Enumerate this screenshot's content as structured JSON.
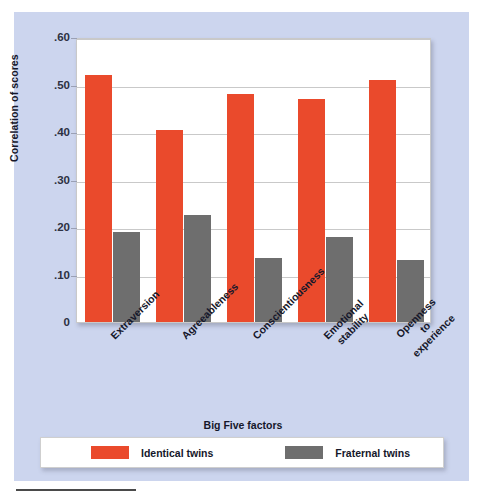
{
  "figure": {
    "background_color": "#ccd5ee",
    "plot_background_color": "#ffffff"
  },
  "colors": {
    "identical_twins": "#ea4a2c",
    "fraternal_twins": "#6e6e6e",
    "gridline": "#c9c9c9",
    "text": "#15172a"
  },
  "axis": {
    "y_title": "Correlation of scores",
    "x_title": "Big Five factors",
    "y_ticks": [
      "0",
      ".10",
      ".20",
      ".30",
      ".40",
      ".50",
      ".60"
    ]
  },
  "legend": {
    "items": [
      {
        "label": "Identical twins",
        "color": "#ea4a2c",
        "swatch": "legend-swatch-identical"
      },
      {
        "label": "Fraternal twins",
        "color": "#6e6e6e",
        "swatch": "legend-swatch-fraternal"
      }
    ]
  },
  "category_labels": [
    {
      "lines": [
        "Extraversion"
      ]
    },
    {
      "lines": [
        "Agreeableness"
      ]
    },
    {
      "lines": [
        "Conscientiousness"
      ]
    },
    {
      "lines": [
        "Emotional",
        "stability"
      ]
    },
    {
      "lines": [
        "Openness",
        "to",
        "experience"
      ]
    }
  ],
  "chart_data": {
    "type": "bar",
    "title": "",
    "xlabel": "Big Five factors",
    "ylabel": "Correlation of scores",
    "ylim": [
      0,
      0.6
    ],
    "yticks": [
      0,
      0.1,
      0.2,
      0.3,
      0.4,
      0.5,
      0.6
    ],
    "ytick_labels": [
      "0",
      ".10",
      ".20",
      ".30",
      ".40",
      ".50",
      ".60"
    ],
    "grid": true,
    "legend_position": "bottom",
    "categories": [
      "Extraversion",
      "Agreeableness",
      "Conscientiousness",
      "Emotional stability",
      "Openness to experience"
    ],
    "series": [
      {
        "name": "Identical twins",
        "color": "#ea4a2c",
        "values": [
          0.52,
          0.405,
          0.48,
          0.47,
          0.51
        ]
      },
      {
        "name": "Fraternal twins",
        "color": "#6e6e6e",
        "values": [
          0.19,
          0.225,
          0.135,
          0.18,
          0.13
        ]
      }
    ]
  }
}
